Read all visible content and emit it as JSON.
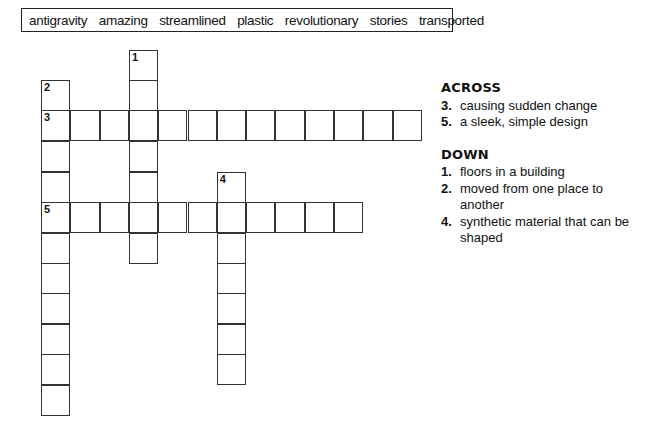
{
  "word_bank": [
    "antigravity",
    "amazing",
    "streamlined",
    "plastic",
    "revolutionary",
    "stories",
    "transported"
  ],
  "grid": {
    "cell_w": 29.3,
    "row_y": [
      50,
      80,
      110,
      141,
      172,
      202,
      233,
      263,
      293,
      324,
      354,
      385
    ],
    "col_x": [
      41,
      70.3,
      99.6,
      128.9,
      158.2,
      187.5,
      216.8,
      246.1,
      275.4,
      304.7,
      334,
      363.3,
      392.6
    ],
    "entries": [
      {
        "number": "1",
        "direction": "down",
        "row": 0,
        "col": 3,
        "length": 7
      },
      {
        "number": "2",
        "direction": "down",
        "row": 1,
        "col": 0,
        "length": 11
      },
      {
        "number": "3",
        "direction": "across",
        "row": 2,
        "col": 0,
        "length": 13
      },
      {
        "number": "4",
        "direction": "down",
        "row": 4,
        "col": 6,
        "length": 7
      },
      {
        "number": "5",
        "direction": "across",
        "row": 5,
        "col": 0,
        "length": 11
      }
    ]
  },
  "clues": {
    "across": {
      "heading": "ACROSS",
      "items": [
        {
          "number": "3.",
          "text": "causing sudden change"
        },
        {
          "number": "5.",
          "text": "a sleek, simple design"
        }
      ]
    },
    "down": {
      "heading": "DOWN",
      "items": [
        {
          "number": "1.",
          "text": "floors in a building"
        },
        {
          "number": "2.",
          "text": "moved from one place to another"
        },
        {
          "number": "4.",
          "text": "synthetic material that can be shaped"
        }
      ]
    }
  }
}
